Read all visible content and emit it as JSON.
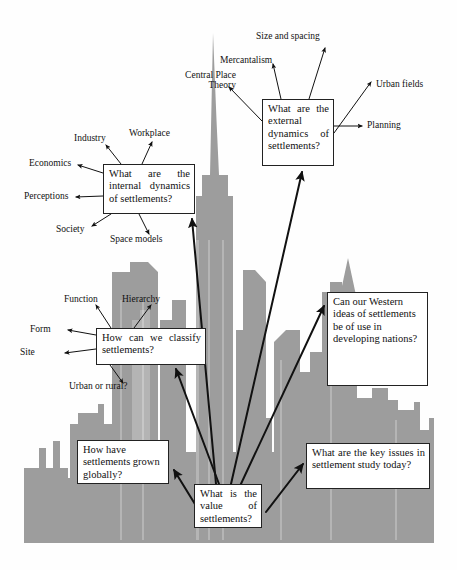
{
  "diagram": {
    "background_shape": "city-skyline-silhouette",
    "colors": {
      "skyline_gray": "#9d9d9d",
      "skyline_gray_light": "#b4b4b4",
      "box_fill": "#ffffff",
      "box_border": "#222222",
      "arrow": "#111111",
      "page_background": "#fefefe"
    }
  },
  "boxes": {
    "central": {
      "text": "What is the value of settlements?",
      "x": 194,
      "y": 484,
      "w": 68,
      "h": 44,
      "font": 10.5
    },
    "internal_dynamics": {
      "text": "What are the internal dynamics of settlements?",
      "x": 103,
      "y": 164,
      "w": 92,
      "h": 50,
      "font": 10.5
    },
    "external_dynamics": {
      "text": "What are the external dynamics of settlements?",
      "x": 262,
      "y": 99,
      "w": 72,
      "h": 67,
      "font": 10.5
    },
    "classify": {
      "text": "How can we classify settlements?",
      "x": 96,
      "y": 328,
      "w": 110,
      "h": 37,
      "font": 10.5
    },
    "western_ideas": {
      "text": "Can our Western ideas of settlements be of use in developing nations?",
      "x": 327,
      "y": 292,
      "w": 101,
      "h": 94,
      "font": 10.5
    },
    "grown_globally": {
      "text": "How have settlements grown globally?",
      "x": 77,
      "y": 440,
      "w": 92,
      "h": 44,
      "font": 10.5
    },
    "key_issues": {
      "text": "What are the key issues in settlement study today?",
      "x": 306,
      "y": 443,
      "w": 124,
      "h": 46,
      "font": 10.5
    }
  },
  "labels": {
    "mercantalism": {
      "text": "Mercantalism",
      "x": 220,
      "y": 55,
      "font": 9.5
    },
    "central_place_theory": {
      "text": "Central Place Theory",
      "x": 174,
      "y": 72,
      "font": 9.5,
      "width": 62
    },
    "size_and_spacing": {
      "text": "Size and spacing",
      "x": 256,
      "y": 31,
      "font": 9.5
    },
    "urban_fields": {
      "text": "Urban fields",
      "x": 376,
      "y": 79,
      "font": 9.5
    },
    "planning": {
      "text": "Planning",
      "x": 367,
      "y": 123,
      "font": 9.5
    },
    "industry": {
      "text": "Industry",
      "x": 74,
      "y": 136,
      "font": 9.5
    },
    "workplace": {
      "text": "Workplace",
      "x": 129,
      "y": 131,
      "font": 9.5
    },
    "economics": {
      "text": "Economics",
      "x": 29,
      "y": 161,
      "font": 9.5
    },
    "perceptions": {
      "text": "Perceptions",
      "x": 24,
      "y": 193,
      "font": 9.5
    },
    "society": {
      "text": "Society",
      "x": 56,
      "y": 225,
      "font": 9.5
    },
    "space_models": {
      "text": "Space models",
      "x": 110,
      "y": 236,
      "font": 9.5
    },
    "function": {
      "text": "Function",
      "x": 64,
      "y": 297,
      "font": 9.5
    },
    "hierarchy": {
      "text": "Hierarchy",
      "x": 122,
      "y": 297,
      "font": 9.5
    },
    "form": {
      "text": "Form",
      "x": 30,
      "y": 328,
      "font": 9.5
    },
    "site": {
      "text": "Site",
      "x": 20,
      "y": 351,
      "font": 9.5
    },
    "urban_or_rural": {
      "text": "Urban or rural?",
      "x": 69,
      "y": 384,
      "font": 9.5
    }
  },
  "arrows": [
    {
      "name": "central-to-internal-dynamics",
      "from": [
        216,
        484
      ],
      "to": [
        191,
        217
      ]
    },
    {
      "name": "central-to-external-dynamics",
      "from": [
        230,
        484
      ],
      "to": [
        303,
        171
      ]
    },
    {
      "name": "central-to-classify",
      "from": [
        220,
        484
      ],
      "to": [
        175,
        370
      ]
    },
    {
      "name": "central-to-western-ideas",
      "from": [
        240,
        484
      ],
      "to": [
        323,
        305
      ]
    },
    {
      "name": "central-to-grown-globally",
      "from": [
        206,
        520
      ],
      "to": [
        174,
        468
      ]
    },
    {
      "name": "central-to-key-issues",
      "from": [
        266,
        510
      ],
      "to": [
        304,
        463
      ]
    },
    {
      "name": "external-to-mercantalism",
      "from": [
        282,
        99
      ],
      "to": [
        272,
        63
      ]
    },
    {
      "name": "external-to-size-and-spacing",
      "from": [
        310,
        99
      ],
      "to": [
        326,
        46
      ]
    },
    {
      "name": "external-to-urban-fields",
      "from": [
        334,
        134
      ],
      "to": [
        372,
        80
      ]
    },
    {
      "name": "external-to-planning",
      "from": [
        334,
        126
      ],
      "to": [
        363,
        125
      ]
    },
    {
      "name": "external-to-central-place-theory",
      "from": [
        262,
        120
      ],
      "to": [
        228,
        86
      ]
    },
    {
      "name": "internal-to-industry",
      "from": [
        120,
        164
      ],
      "to": [
        104,
        143
      ]
    },
    {
      "name": "internal-to-workplace",
      "from": [
        142,
        164
      ],
      "to": [
        153,
        140
      ]
    },
    {
      "name": "internal-to-economics",
      "from": [
        103,
        172
      ],
      "to": [
        76,
        163
      ]
    },
    {
      "name": "internal-to-perceptions",
      "from": [
        103,
        196
      ],
      "to": [
        74,
        197
      ]
    },
    {
      "name": "internal-to-society",
      "from": [
        110,
        214
      ],
      "to": [
        90,
        227
      ]
    },
    {
      "name": "internal-to-space-models",
      "from": [
        140,
        214
      ],
      "to": [
        150,
        236
      ]
    },
    {
      "name": "classify-to-function",
      "from": [
        110,
        328
      ],
      "to": [
        95,
        303
      ]
    },
    {
      "name": "classify-to-hierarchy",
      "from": [
        134,
        328
      ],
      "to": [
        152,
        303
      ]
    },
    {
      "name": "classify-to-form",
      "from": [
        96,
        334
      ],
      "to": [
        66,
        330
      ]
    },
    {
      "name": "classify-to-site",
      "from": [
        96,
        348
      ],
      "to": [
        63,
        352
      ]
    },
    {
      "name": "classify-to-urban-or-rural",
      "from": [
        110,
        365
      ],
      "to": [
        124,
        385
      ]
    }
  ],
  "skyline": {
    "description": "Gray city skyline silhouette with tall central spire tower",
    "gray": "#9d9d9d"
  }
}
